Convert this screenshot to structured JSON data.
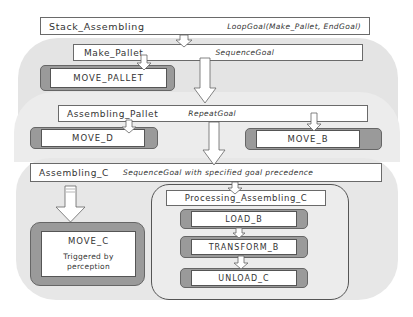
{
  "diagram": {
    "goals": {
      "stack_assembling": {
        "name": "Stack_Assembling",
        "type": "LoopGoal(Make_Pallet, EndGoal)"
      },
      "make_pallet": {
        "name": "Make_Pallet",
        "type": "SequenceGoal"
      },
      "assembling_pallet": {
        "name": "Assembling_Pallet",
        "type": "RepeatGoal"
      },
      "assembling_c": {
        "name": "Assembling_C",
        "type": "SequenceGoal with specified goal precedence"
      },
      "processing_assembling_c": {
        "name": "Processing_Assembling_C"
      }
    },
    "actions": {
      "move_pallet": "MOVE_PALLET",
      "move_d": "MOVE_D",
      "move_b": "MOVE_B",
      "move_c": "MOVE_C",
      "move_c_note": "Triggered by perception",
      "move_c_note_line1": "Triggered by",
      "move_c_note_line2": "perception",
      "load_b": "LOAD_B",
      "transform_b": "TRANSFORM_B",
      "unload_c": "UNLOAD_C"
    },
    "edges": [
      {
        "from": "Stack_Assembling",
        "to": "Make_Pallet"
      },
      {
        "from": "Make_Pallet",
        "to": "MOVE_PALLET"
      },
      {
        "from": "Make_Pallet",
        "to": "Assembling_Pallet"
      },
      {
        "from": "Assembling_Pallet",
        "to": "MOVE_D"
      },
      {
        "from": "Assembling_Pallet",
        "to": "MOVE_B"
      },
      {
        "from": "Assembling_Pallet",
        "to": "Assembling_C"
      },
      {
        "from": "Assembling_C",
        "to": "MOVE_C"
      },
      {
        "from": "Assembling_C",
        "to": "Processing_Assembling_C"
      },
      {
        "from": "LOAD_B",
        "to": "TRANSFORM_B"
      },
      {
        "from": "TRANSFORM_B",
        "to": "UNLOAD_C"
      }
    ],
    "colors": {
      "background": "#ffffff",
      "region": "#e6e6e6",
      "action_frame": "#9a9a9a",
      "box_border": "#6a6a6a",
      "text": "#333333"
    }
  }
}
